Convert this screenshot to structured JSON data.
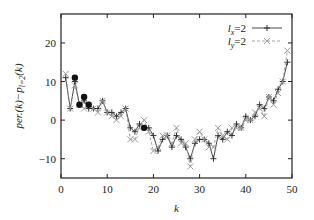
{
  "chart_data": {
    "type": "line",
    "title": "",
    "xlabel": "k",
    "ylabel": "per.(k)−p_{l=2}(k)",
    "xlim": [
      0,
      50
    ],
    "ylim": [
      -15,
      27.5
    ],
    "xticks": [
      0,
      10,
      20,
      30,
      40,
      50
    ],
    "yticks": [
      -10,
      0,
      10,
      20
    ],
    "xtick_labels": [
      "0",
      "10",
      "20",
      "30",
      "40",
      "50"
    ],
    "ytick_labels": [
      "−10",
      "0",
      "10",
      "20"
    ],
    "grid": false,
    "legend_position": "top-right",
    "series": [
      {
        "name": "l_x=2",
        "style": "solid",
        "marker": "+",
        "color": "#333333",
        "x": [
          1,
          2,
          3,
          4,
          5,
          6,
          7,
          8,
          9,
          10,
          11,
          12,
          13,
          14,
          15,
          16,
          17,
          18,
          19,
          20,
          21,
          22,
          23,
          24,
          25,
          26,
          27,
          28,
          29,
          30,
          31,
          32,
          33,
          34,
          35,
          36,
          37,
          38,
          39,
          40,
          41,
          42,
          43,
          44,
          45,
          46,
          47,
          48,
          49
        ],
        "values": [
          11,
          3,
          10,
          4,
          5,
          3,
          3,
          3,
          5,
          2,
          2,
          1,
          2,
          3,
          -2,
          -3,
          -1,
          -2,
          -2,
          -4,
          -8,
          -5,
          -4,
          -7,
          -4,
          -5,
          -7,
          -10,
          -6,
          -5,
          -5,
          -6,
          -10,
          -4,
          -5,
          -3,
          -4,
          -1,
          -2,
          1,
          0,
          1,
          4,
          3,
          6,
          5,
          8,
          10,
          15
        ]
      },
      {
        "name": "l_y=2",
        "style": "dashed",
        "marker": "x",
        "color": "#999999",
        "x": [
          1,
          2,
          3,
          4,
          5,
          6,
          7,
          8,
          9,
          10,
          11,
          12,
          13,
          14,
          15,
          16,
          17,
          18,
          19,
          20,
          21,
          22,
          23,
          24,
          25,
          26,
          27,
          28,
          29,
          30,
          31,
          32,
          33,
          34,
          35,
          36,
          37,
          38,
          39,
          40,
          41,
          42,
          43,
          44,
          45,
          46,
          47,
          48,
          49
        ],
        "values": [
          12,
          3,
          9,
          4,
          3,
          4,
          3,
          2,
          5,
          2,
          1,
          0,
          1,
          3,
          -5,
          -5,
          -2,
          0,
          -3,
          -8,
          -7,
          -4,
          -4,
          -6,
          -2,
          -6,
          -6,
          -12,
          -5,
          -3,
          -5,
          -7,
          -7,
          -2,
          -4,
          -5,
          -2,
          -2,
          -2,
          0,
          0,
          2,
          3,
          1,
          6,
          4,
          7,
          10,
          18
        ]
      },
      {
        "name": "highlighted points",
        "style": "none",
        "marker": "filled-circle",
        "color": "#111111",
        "x": [
          3,
          4,
          5,
          6,
          18
        ],
        "values": [
          11,
          4,
          6,
          4,
          -2
        ]
      }
    ]
  },
  "legend": {
    "items": [
      {
        "label": "l",
        "sub": "x",
        "eq": "=2"
      },
      {
        "label": "l",
        "sub": "y",
        "eq": "=2"
      }
    ]
  },
  "axes": {
    "xlabel": "k",
    "ylabel_main": "per.(k)−p",
    "ylabel_sub": "l=2",
    "ylabel_tail": "(k)"
  }
}
